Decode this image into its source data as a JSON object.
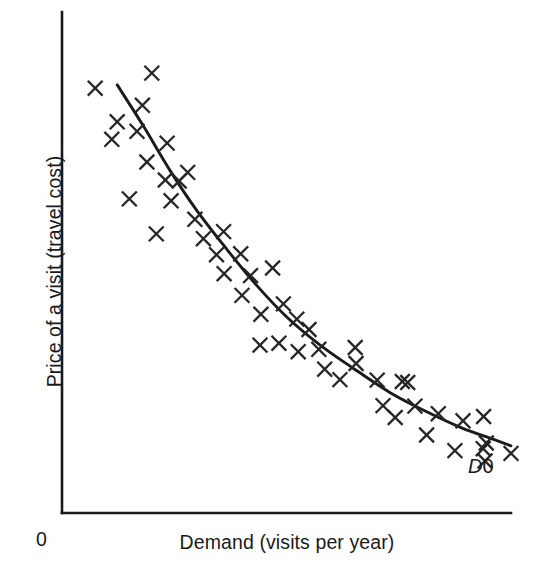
{
  "figure": {
    "background_color": "#ffffff",
    "ink_color": "#1a1a1a"
  },
  "labels": {
    "y_axis": "Price of a visit (travel cost)",
    "x_axis": "Demand (visits per year)",
    "origin": "0",
    "curve_symbol": "D",
    "curve_subscript": "0",
    "curve_full": "D0"
  },
  "chart_data": {
    "type": "scatter",
    "title": "",
    "xlabel": "Demand (visits per year)",
    "ylabel": "Price of a visit (travel cost)",
    "grid": false,
    "legend": false,
    "axis_origin_label": "0",
    "xlim": [
      0,
      100
    ],
    "ylim": [
      0,
      100
    ],
    "axis_ticks": {
      "x": [],
      "y": []
    },
    "annotations": [
      {
        "text": "D0",
        "x": 92.6,
        "y": 9.0,
        "italic_part": "D",
        "describes": "fitted demand curve"
      }
    ],
    "series": [
      {
        "name": "observed visits",
        "type": "scatter",
        "marker": "x",
        "color": "#262626",
        "points": [
          [
            7.4,
            89.8
          ],
          [
            20.0,
            93.0
          ],
          [
            17.9,
            86.2
          ],
          [
            12.3,
            82.7
          ],
          [
            16.7,
            80.7
          ],
          [
            11.1,
            79.0
          ],
          [
            23.4,
            78.2
          ],
          [
            18.9,
            74.2
          ],
          [
            26.1,
            70.2
          ],
          [
            23.0,
            70.4
          ],
          [
            15.0,
            66.4
          ],
          [
            24.3,
            66.0
          ],
          [
            29.6,
            62.1
          ],
          [
            21.0,
            59.0
          ],
          [
            31.5,
            58.0
          ],
          [
            34.4,
            54.6
          ],
          [
            39.8,
            54.8
          ],
          [
            36.1,
            50.6
          ],
          [
            42.0,
            50.2
          ],
          [
            46.9,
            51.8
          ],
          [
            40.1,
            46.0
          ],
          [
            44.3,
            42.0
          ],
          [
            49.3,
            44.2
          ],
          [
            52.3,
            41.0
          ],
          [
            55.0,
            38.8
          ],
          [
            48.3,
            35.9
          ],
          [
            52.6,
            34.1
          ],
          [
            57.2,
            34.6
          ],
          [
            44.1,
            35.5
          ],
          [
            65.3,
            35.0
          ],
          [
            65.5,
            31.6
          ],
          [
            61.9,
            28.2
          ],
          [
            70.2,
            28.1
          ],
          [
            75.8,
            27.8
          ],
          [
            77.0,
            27.6
          ],
          [
            71.5,
            22.7
          ],
          [
            78.6,
            22.6
          ],
          [
            83.8,
            21.0
          ],
          [
            74.2,
            20.2
          ],
          [
            89.3,
            19.5
          ],
          [
            93.9,
            20.4
          ],
          [
            81.2,
            16.5
          ],
          [
            94.5,
            14.8
          ],
          [
            93.8,
            13.6
          ],
          [
            87.5,
            13.2
          ],
          [
            94.2,
            11.0
          ],
          [
            100.0,
            12.6
          ],
          [
            58.5,
            30.4
          ],
          [
            36.0,
            59.5
          ],
          [
            28.0,
            72.0
          ]
        ]
      },
      {
        "name": "fitted demand curve D0",
        "type": "line",
        "color": "#1a1a1a",
        "points": [
          [
            12.3,
            90.5
          ],
          [
            18.0,
            82.0
          ],
          [
            24.0,
            72.5
          ],
          [
            30.0,
            64.0
          ],
          [
            36.5,
            56.0
          ],
          [
            43.0,
            48.5
          ],
          [
            50.0,
            41.5
          ],
          [
            57.5,
            35.5
          ],
          [
            65.0,
            30.5
          ],
          [
            73.0,
            25.5
          ],
          [
            81.0,
            21.5
          ],
          [
            89.0,
            18.0
          ],
          [
            96.0,
            15.6
          ],
          [
            100.0,
            14.2
          ]
        ]
      }
    ]
  }
}
